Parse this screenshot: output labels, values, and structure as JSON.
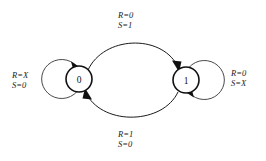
{
  "diagram": {
    "type": "state-transition-diagram",
    "colors": {
      "background": "#ffffff",
      "node_stroke": "#111111",
      "edge_stroke": "#1a1a1a",
      "loop_stroke": "#4a4a4a",
      "text": "#1a1a1a"
    },
    "states": [
      {
        "id": "s0",
        "label": "0",
        "cx": 79,
        "cy": 79,
        "r": 13
      },
      {
        "id": "s1",
        "label": "1",
        "cx": 186,
        "cy": 80,
        "r": 13
      }
    ],
    "transitions": [
      {
        "id": "t-0-to-1",
        "from": "0",
        "to": "1",
        "shape": "arc-above",
        "label_lines": [
          "R=0",
          "S=1"
        ]
      },
      {
        "id": "t-1-to-0",
        "from": "1",
        "to": "0",
        "shape": "arc-below",
        "label_lines": [
          "R=1",
          "S=0"
        ]
      },
      {
        "id": "t-0-self",
        "from": "0",
        "to": "0",
        "shape": "self-loop-left",
        "label_lines": [
          "R=X",
          "S=0"
        ]
      },
      {
        "id": "t-1-self",
        "from": "1",
        "to": "1",
        "shape": "self-loop-right",
        "label_lines": [
          "R=0",
          "S=X"
        ]
      }
    ]
  }
}
